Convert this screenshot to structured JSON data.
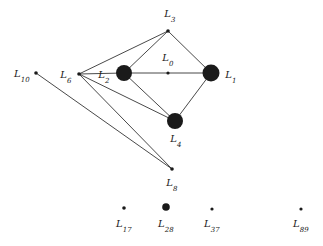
{
  "figure": {
    "type": "graph-diagram",
    "background_color": "#ffffff",
    "ink_color": "#1a1a1a",
    "width": 323,
    "height": 246
  },
  "nodes": [
    {
      "id": "L0",
      "label": "L",
      "sub": "0",
      "x": 168,
      "y": 73,
      "radius": 1.6,
      "label_x": 168,
      "label_y": 58
    },
    {
      "id": "L1",
      "label": "L",
      "sub": "1",
      "x": 211,
      "y": 73,
      "radius": 8.5,
      "label_x": 231,
      "label_y": 75
    },
    {
      "id": "L2",
      "label": "L",
      "sub": "2",
      "x": 124,
      "y": 73,
      "radius": 8.0,
      "label_x": 104,
      "label_y": 75
    },
    {
      "id": "L3",
      "label": "L",
      "sub": "3",
      "x": 168,
      "y": 31,
      "radius": 1.8,
      "label_x": 170,
      "label_y": 14
    },
    {
      "id": "L4",
      "label": "L",
      "sub": "4",
      "x": 175,
      "y": 121,
      "radius": 8.0,
      "label_x": 176,
      "label_y": 139
    },
    {
      "id": "L6",
      "label": "L",
      "sub": "6",
      "x": 79,
      "y": 74,
      "radius": 1.8,
      "label_x": 66,
      "label_y": 75
    },
    {
      "id": "L8",
      "label": "L",
      "sub": "8",
      "x": 172,
      "y": 169,
      "radius": 1.8,
      "label_x": 172,
      "label_y": 183
    },
    {
      "id": "L10",
      "label": "L",
      "sub": "10",
      "x": 36,
      "y": 73,
      "radius": 1.8,
      "label_x": 22,
      "label_y": 74
    },
    {
      "id": "L17",
      "label": "L",
      "sub": "17",
      "x": 124,
      "y": 208,
      "radius": 1.8,
      "label_x": 124,
      "label_y": 224
    },
    {
      "id": "L28",
      "label": "L",
      "sub": "28",
      "x": 166,
      "y": 207,
      "radius": 3.8,
      "label_x": 166,
      "label_y": 224
    },
    {
      "id": "L37",
      "label": "L",
      "sub": "37",
      "x": 212,
      "y": 209,
      "radius": 1.6,
      "label_x": 212,
      "label_y": 224
    },
    {
      "id": "L89",
      "label": "L",
      "sub": "89",
      "x": 301,
      "y": 209,
      "radius": 1.6,
      "label_x": 301,
      "label_y": 224
    }
  ],
  "edges": [
    {
      "from": "L3",
      "to": "L6"
    },
    {
      "from": "L3",
      "to": "L2"
    },
    {
      "from": "L3",
      "to": "L1"
    },
    {
      "from": "L2",
      "to": "L1"
    },
    {
      "from": "L2",
      "to": "L4"
    },
    {
      "from": "L1",
      "to": "L4"
    },
    {
      "from": "L6",
      "to": "L2"
    },
    {
      "from": "L6",
      "to": "L4"
    },
    {
      "from": "L6",
      "to": "L8"
    },
    {
      "from": "L10",
      "to": "L8"
    }
  ]
}
